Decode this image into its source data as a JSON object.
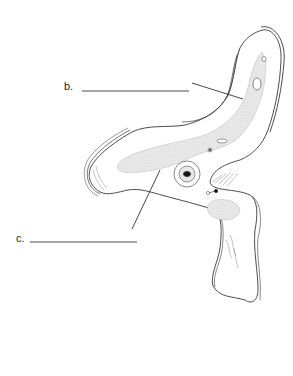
{
  "diagram": {
    "type": "anatomical-cross-section",
    "labels": [
      {
        "id": "b",
        "text": "b.",
        "answer_line": "blank"
      },
      {
        "id": "c",
        "text": "c.",
        "answer_line": "blank"
      }
    ],
    "colors": {
      "outline": "#3a3a3a",
      "stipple": "#cfcfcf",
      "background": "#ffffff"
    }
  }
}
